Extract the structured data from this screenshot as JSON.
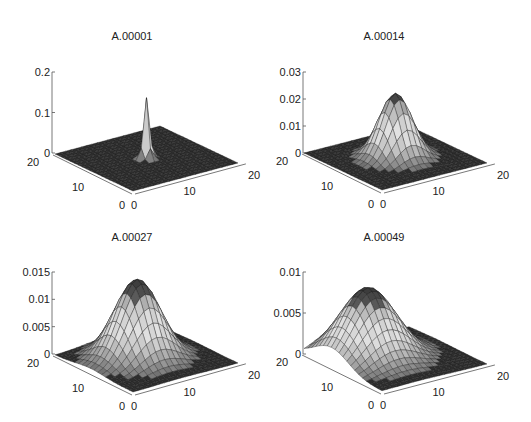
{
  "figure": {
    "background": "#ffffff",
    "axis_color": "#555555",
    "mesh_color": "#1a1a1a"
  },
  "chart_data": [
    {
      "type": "surface3d",
      "title": "A.00001",
      "x_ticks": [
        "0",
        "10",
        "20"
      ],
      "y_ticks": [
        "0",
        "10",
        "20"
      ],
      "z_ticks": [
        "0",
        "0.1",
        "0.2"
      ],
      "zlim": [
        0,
        0.2
      ],
      "grid_size": 21,
      "peak": {
        "x": 10,
        "y": 10,
        "height": 0.15,
        "sigma": 0.55
      },
      "description": "Sharp single spike at grid center"
    },
    {
      "type": "surface3d",
      "title": "A.00014",
      "x_ticks": [
        "0",
        "10",
        "20"
      ],
      "y_ticks": [
        "0",
        "10",
        "20"
      ],
      "z_ticks": [
        "0",
        "0.01",
        "0.02",
        "0.03"
      ],
      "zlim": [
        0,
        0.03
      ],
      "grid_size": 21,
      "peak": {
        "x": 10,
        "y": 10,
        "height": 0.024,
        "sigma": 2.6
      },
      "description": "Gaussian bump centered at (10,10)"
    },
    {
      "type": "surface3d",
      "title": "A.00027",
      "x_ticks": [
        "0",
        "10",
        "20"
      ],
      "y_ticks": [
        "0",
        "10",
        "20"
      ],
      "z_ticks": [
        "0",
        "0.005",
        "0.01",
        "0.015"
      ],
      "zlim": [
        0,
        0.015
      ],
      "grid_size": 21,
      "peak": {
        "x": 9,
        "y": 11,
        "height": 0.0145,
        "sigma": 3.6
      },
      "description": "Wider Gaussian, slightly shifted"
    },
    {
      "type": "surface3d",
      "title": "A.00049",
      "x_ticks": [
        "0",
        "10",
        "20"
      ],
      "y_ticks": [
        "0",
        "10",
        "20"
      ],
      "z_ticks": [
        "0",
        "0.005",
        "0.01"
      ],
      "zlim": [
        0,
        0.01
      ],
      "grid_size": 21,
      "peak": {
        "x": 7,
        "y": 13,
        "height": 0.0085,
        "sigma": 4.4
      },
      "description": "Broad diffused bump drifting toward back-left"
    }
  ],
  "layout": {
    "panels": [
      {
        "title_pos": [
          132,
          30
        ],
        "zaxis_x": 52,
        "z0_y": 153,
        "ztop_y": 72,
        "back": [
          55,
          154
        ],
        "origin": [
          133,
          191
        ],
        "right": [
          238,
          163
        ]
      },
      {
        "title_pos": [
          384,
          30
        ],
        "zaxis_x": 303,
        "z0_y": 153,
        "ztop_y": 72,
        "back": [
          304,
          153
        ],
        "origin": [
          382,
          190
        ],
        "right": [
          487,
          163
        ]
      },
      {
        "title_pos": [
          132,
          231
        ],
        "zaxis_x": 52,
        "z0_y": 354,
        "ztop_y": 272,
        "back": [
          55,
          355
        ],
        "origin": [
          133,
          392
        ],
        "right": [
          238,
          363
        ]
      },
      {
        "title_pos": [
          384,
          231
        ],
        "zaxis_x": 303,
        "z0_y": 354,
        "ztop_y": 272,
        "back": [
          304,
          354
        ],
        "origin": [
          382,
          391
        ],
        "right": [
          487,
          364
        ]
      }
    ]
  }
}
